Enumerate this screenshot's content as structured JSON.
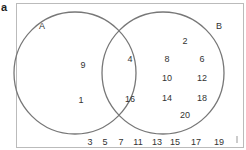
{
  "panel_label": "a",
  "colors": {
    "box_stroke": "#bbbbbb",
    "circle_stroke": "#777777",
    "text": "#333333"
  },
  "universe": {
    "outside_elements": [
      "3",
      "5",
      "7",
      "11",
      "13",
      "15",
      "17",
      "19"
    ]
  },
  "sets": [
    {
      "name": "A",
      "only_elements": [
        "9",
        "1"
      ]
    },
    {
      "name": "B",
      "only_elements": [
        "2",
        "8",
        "6",
        "10",
        "12",
        "14",
        "18",
        "20"
      ]
    }
  ],
  "intersection": {
    "elements": [
      "4",
      "16"
    ]
  }
}
